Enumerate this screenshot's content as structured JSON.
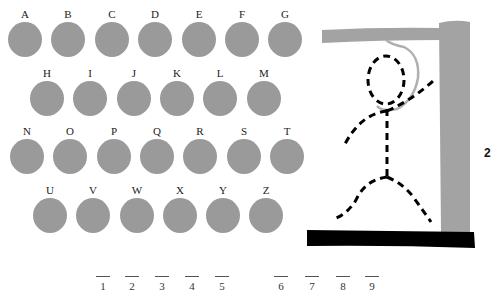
{
  "keyboard": {
    "row1": [
      "A",
      "B",
      "C",
      "D",
      "E",
      "F",
      "G"
    ],
    "row2": [
      "H",
      "I",
      "J",
      "K",
      "L",
      "M"
    ],
    "row3": [
      "N",
      "O",
      "P",
      "Q",
      "R",
      "S",
      "T"
    ],
    "row4": [
      "U",
      "V",
      "W",
      "X",
      "Y",
      "Z"
    ],
    "key_color": "#9a9a9a"
  },
  "word_blanks": {
    "group1": [
      "1",
      "2",
      "3",
      "4",
      "5"
    ],
    "group2": [
      "6",
      "7",
      "8",
      "9"
    ]
  },
  "gallows": {
    "wood_color": "#a3a3a3",
    "base_color": "#000000",
    "figure_color": "#000000",
    "rope_color": "#b0b0b0",
    "parts_drawn": [
      "head",
      "body",
      "left-arm",
      "right-arm",
      "left-leg",
      "right-leg"
    ]
  },
  "side_counter": {
    "text": "2"
  }
}
